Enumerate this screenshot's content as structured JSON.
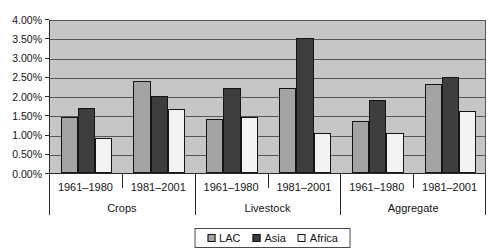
{
  "chart_data": {
    "type": "bar",
    "title": "",
    "xlabel": "",
    "ylabel": "",
    "unit": "percent",
    "grid": "horizontal",
    "plot_background": "#c6c6c6",
    "gridline_color": "#565656",
    "y_axis": {
      "min": 0,
      "max": 4.0,
      "step": 0.5,
      "tick_labels": [
        "0.00%",
        "0.50%",
        "1.00%",
        "1.50%",
        "2.00%",
        "2.50%",
        "3.00%",
        "3.50%",
        "4.00%"
      ]
    },
    "group_labels": [
      "Crops",
      "Livestock",
      "Aggregate"
    ],
    "period_labels": [
      "1961–1980",
      "1981–2001"
    ],
    "categories": [
      {
        "group": "Crops",
        "period": "1961–1980"
      },
      {
        "group": "Crops",
        "period": "1981–2001"
      },
      {
        "group": "Livestock",
        "period": "1961–1980"
      },
      {
        "group": "Livestock",
        "period": "1981–2001"
      },
      {
        "group": "Aggregate",
        "period": "1961–1980"
      },
      {
        "group": "Aggregate",
        "period": "1981–2001"
      }
    ],
    "series": [
      {
        "name": "LAC",
        "color": "#a4a4a4",
        "values": [
          1.45,
          2.4,
          1.4,
          2.2,
          1.35,
          2.3
        ]
      },
      {
        "name": "Asia",
        "color": "#3e3e3e",
        "values": [
          1.7,
          2.0,
          2.2,
          3.5,
          1.9,
          2.5
        ]
      },
      {
        "name": "Africa",
        "color": "#f3f3f3",
        "values": [
          0.9,
          1.65,
          1.45,
          1.05,
          1.05,
          1.6
        ]
      }
    ],
    "legend": {
      "position": "bottom",
      "entries": [
        "LAC",
        "Asia",
        "Africa"
      ]
    }
  }
}
